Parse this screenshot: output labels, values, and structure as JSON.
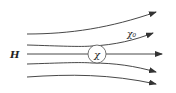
{
  "diagram": {
    "type": "field-lines",
    "labels": {
      "field": "H",
      "medium": "χ₀",
      "sphere": "χ"
    },
    "colors": {
      "line": "#333333",
      "background": "#ffffff"
    },
    "field_lines": 5
  }
}
